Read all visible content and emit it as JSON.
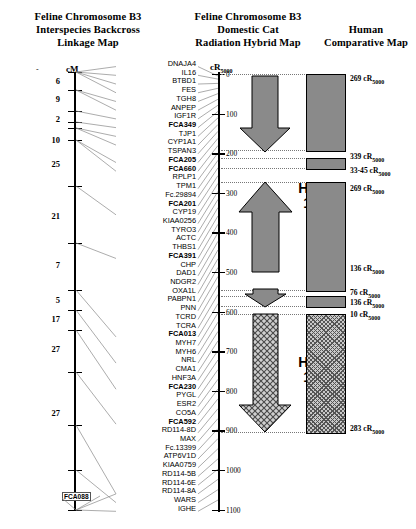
{
  "headers": {
    "linkage": "Feline Chromosome B3\nInterspecies Backcross\nLinkage Map",
    "linkage_l1": "Feline Chromosome B3",
    "linkage_l2": "Interspecies Backcross",
    "linkage_l3": "Linkage Map",
    "rh_l1": "Feline Chromosome B3",
    "rh_l2": "Domestic Cat",
    "rh_l3": "Radiation Hybrid Map",
    "human_l1": "Human",
    "human_l2": "Comparative Map"
  },
  "linkage_map": {
    "unit_label": "cM",
    "distances": [
      "6",
      "9",
      "2",
      "10",
      "25",
      "21",
      "7",
      "5",
      "17",
      "27",
      "27"
    ],
    "marker_tag": "FCA088"
  },
  "rh_map": {
    "unit_label": "cR",
    "unit_sub": "5000",
    "scale_ticks": [
      "0",
      "100",
      "200",
      "300",
      "400",
      "500",
      "600",
      "700",
      "800",
      "900",
      "1000",
      "1100"
    ]
  },
  "genes": [
    {
      "name": "DNAJA4",
      "bold": false
    },
    {
      "name": "IL16",
      "bold": false
    },
    {
      "name": "BTBD1",
      "bold": false
    },
    {
      "name": "FES",
      "bold": false
    },
    {
      "name": "TGH8",
      "bold": false
    },
    {
      "name": "ANPEP",
      "bold": false
    },
    {
      "name": "IGF1R",
      "bold": false
    },
    {
      "name": "FCA349",
      "bold": true
    },
    {
      "name": "TJP1",
      "bold": false
    },
    {
      "name": "CYP1A1",
      "bold": false
    },
    {
      "name": "TSPAN3",
      "bold": false
    },
    {
      "name": "FCA205",
      "bold": true
    },
    {
      "name": "FCA660",
      "bold": true
    },
    {
      "name": "RPLP1",
      "bold": false
    },
    {
      "name": "TPM1",
      "bold": false
    },
    {
      "name": "Fc.29894",
      "bold": false
    },
    {
      "name": "FCA201",
      "bold": true
    },
    {
      "name": "CYP19",
      "bold": false
    },
    {
      "name": "KIAA0256",
      "bold": false
    },
    {
      "name": "TYRO3",
      "bold": false
    },
    {
      "name": "ACTC",
      "bold": false
    },
    {
      "name": "THBS1",
      "bold": false
    },
    {
      "name": "FCA391",
      "bold": true
    },
    {
      "name": "CHP",
      "bold": false
    },
    {
      "name": "DAD1",
      "bold": false
    },
    {
      "name": "NDGR2",
      "bold": false
    },
    {
      "name": "OXA1L",
      "bold": false
    },
    {
      "name": "PABPN1",
      "bold": false
    },
    {
      "name": "PNN",
      "bold": false
    },
    {
      "name": "TCRD",
      "bold": false
    },
    {
      "name": "TCRA",
      "bold": false
    },
    {
      "name": "FCA013",
      "bold": true
    },
    {
      "name": "MYH7",
      "bold": false
    },
    {
      "name": "MYH6",
      "bold": false
    },
    {
      "name": "NRL",
      "bold": false
    },
    {
      "name": "CMA1",
      "bold": false
    },
    {
      "name": "HNF3A",
      "bold": false
    },
    {
      "name": "FCA230",
      "bold": true
    },
    {
      "name": "PYGL",
      "bold": false
    },
    {
      "name": "ESR2",
      "bold": false
    },
    {
      "name": "CO5A",
      "bold": false
    },
    {
      "name": "FCA592",
      "bold": true
    },
    {
      "name": "RD114-8D",
      "bold": false
    },
    {
      "name": "MAX",
      "bold": false
    },
    {
      "name": "Fc.13399",
      "bold": false
    },
    {
      "name": "ATP6V1D",
      "bold": false
    },
    {
      "name": "KIAA0759",
      "bold": false
    },
    {
      "name": "RD114-5B",
      "bold": false
    },
    {
      "name": "RD114-6E",
      "bold": false
    },
    {
      "name": "RD114-8A",
      "bold": false
    },
    {
      "name": "WARS",
      "bold": false
    },
    {
      "name": "IGHE",
      "bold": false
    }
  ],
  "human_map": {
    "chromosome_labels": [
      {
        "text": "Hsa",
        "number": "15"
      },
      {
        "text": "Hsa",
        "number": "14"
      }
    ],
    "hsa15_label": "Hsa",
    "hsa15_number": "15",
    "hsa14_label": "Hsa",
    "hsa14_number": "14",
    "segments": [
      {
        "size": "269 cR",
        "sub": "5000",
        "fill": "solid"
      },
      {
        "size": "339 cR",
        "sub": "5000",
        "fill": "none"
      },
      {
        "size": "33-45 cR",
        "sub": "5000",
        "fill": "solid"
      },
      {
        "size": "269 cR",
        "sub": "5000",
        "fill": "solid"
      },
      {
        "size": "136 cR",
        "sub": "5000",
        "fill": "none"
      },
      {
        "size": "76 cR",
        "sub": "5000",
        "fill": "solid"
      },
      {
        "size": "136 cR",
        "sub": "5000",
        "fill": "none"
      },
      {
        "size": "10 cR",
        "sub": "5000",
        "fill": "hatch"
      },
      {
        "size": "283 cR",
        "sub": "5000",
        "fill": "hatch"
      }
    ],
    "labels": [
      "269 cR",
      "339 cR",
      "33-45 cR",
      "269 cR",
      "136 cR",
      "76 cR",
      "136 cR",
      "10 cR",
      "283 cR"
    ]
  },
  "colors": {
    "block_solid": "#8a8a8a",
    "arrow_fill": "#8a8a8a",
    "outline": "#000000",
    "guide": "#777777",
    "connector": "#888888"
  }
}
